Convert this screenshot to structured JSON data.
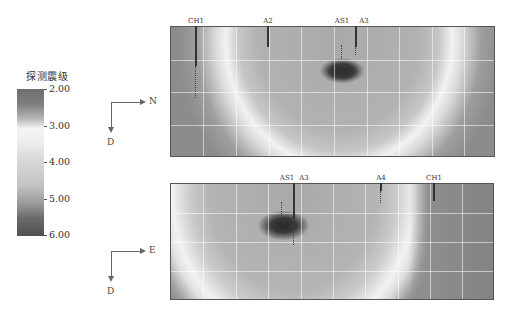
{
  "colorbar": {
    "title": "探测震级",
    "ticks": [
      "2.00",
      "3.00",
      "4.00",
      "5.00",
      "6.00"
    ]
  },
  "top_panel": {
    "axes": {
      "horizontal": "N",
      "vertical": "D"
    },
    "probes": [
      {
        "label": "CH1"
      },
      {
        "label": "A2"
      },
      {
        "label": "AS1"
      },
      {
        "label": "A3"
      }
    ]
  },
  "bottom_panel": {
    "axes": {
      "horizontal": "E",
      "vertical": "D"
    },
    "probes": [
      {
        "label": "AS1"
      },
      {
        "label": "A3"
      },
      {
        "label": "A4"
      },
      {
        "label": "CH1"
      }
    ]
  }
}
